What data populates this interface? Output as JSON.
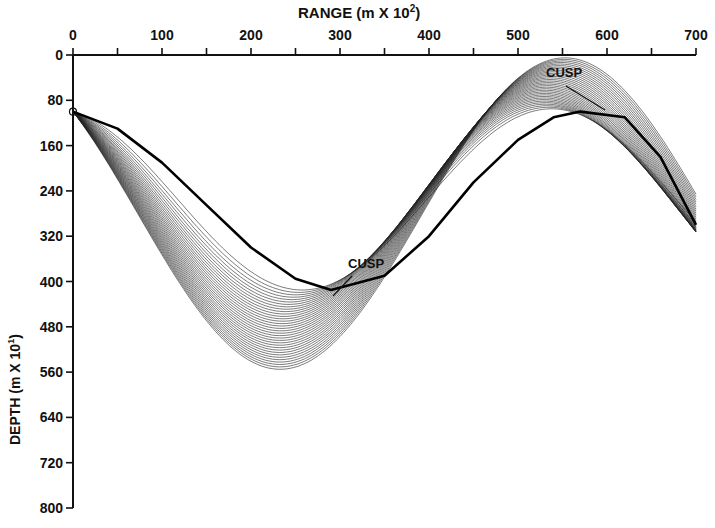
{
  "chart_data": {
    "type": "line",
    "title": "",
    "xlabel": "RANGE (m X 10²)",
    "ylabel": "DEPTH (m X 10¹)",
    "xlim": [
      0,
      700
    ],
    "ylim": [
      0,
      800
    ],
    "y_inverted": true,
    "x_axis_position": "top",
    "x_ticks": [
      0,
      100,
      200,
      300,
      400,
      500,
      600,
      700
    ],
    "x_minor_ticks": [
      50,
      150,
      250,
      350,
      450,
      550,
      650
    ],
    "y_ticks": [
      0,
      80,
      160,
      240,
      320,
      400,
      480,
      560,
      640,
      720,
      800
    ],
    "grid": false,
    "legend": null,
    "source": {
      "range": 0,
      "depth": 100
    },
    "ray_family": {
      "count": 34,
      "description": "Fan of refracted acoustic ray paths launched from a source at ~100 depth units; rays oscillate sinusoidally in depth with range, forming caustics",
      "upper_turning_depth_range": [
        5,
        95
      ],
      "lower_turning_depth_range": [
        415,
        555
      ],
      "first_lower_turning_range": [
        200,
        300
      ],
      "first_upper_turning_range": [
        540,
        700
      ]
    },
    "caustic_envelope": [
      {
        "range": 0,
        "depth": 100
      },
      {
        "range": 50,
        "depth": 130
      },
      {
        "range": 100,
        "depth": 190
      },
      {
        "range": 150,
        "depth": 265
      },
      {
        "range": 200,
        "depth": 340
      },
      {
        "range": 250,
        "depth": 395
      },
      {
        "range": 290,
        "depth": 415
      },
      {
        "range": 350,
        "depth": 390
      },
      {
        "range": 400,
        "depth": 320
      },
      {
        "range": 450,
        "depth": 225
      },
      {
        "range": 500,
        "depth": 150
      },
      {
        "range": 540,
        "depth": 110
      },
      {
        "range": 570,
        "depth": 100
      },
      {
        "range": 620,
        "depth": 110
      },
      {
        "range": 660,
        "depth": 180
      },
      {
        "range": 700,
        "depth": 300
      }
    ],
    "annotations": [
      {
        "text": "CUSP",
        "range": 290,
        "depth": 415,
        "label_range": 325,
        "label_depth": 360
      },
      {
        "text": "CUSP",
        "range": 570,
        "depth": 100,
        "label_range": 535,
        "label_depth": 40
      }
    ]
  },
  "axes": {
    "x_title": "RANGE (m X 10",
    "x_title_sup": "2",
    "x_title_end": ")",
    "y_title": "DEPTH (m X 10",
    "y_title_sup": "1",
    "y_title_end": ")"
  },
  "labels": {
    "cusp_1": "CUSP",
    "cusp_2": "CUSP"
  }
}
